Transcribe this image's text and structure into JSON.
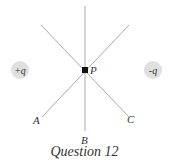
{
  "diagram": {
    "caption": "Question 12",
    "point": {
      "label": "P",
      "x": 85,
      "y": 70
    },
    "charges": [
      {
        "label": "+q",
        "x": 20,
        "y": 70
      },
      {
        "label": "-q",
        "x": 153,
        "y": 70
      }
    ],
    "lines": [
      {
        "label": "A",
        "from": [
          129,
          25
        ],
        "to": [
          42,
          117
        ]
      },
      {
        "label": "B",
        "from": [
          85,
          6
        ],
        "to": [
          85,
          131
        ]
      },
      {
        "label": "C",
        "from": [
          41,
          25
        ],
        "to": [
          129,
          117
        ]
      }
    ],
    "colors": {
      "line": "#aaaaaa",
      "charge_fill": "#dddddd",
      "point": "#111111",
      "text": "#333333"
    }
  }
}
